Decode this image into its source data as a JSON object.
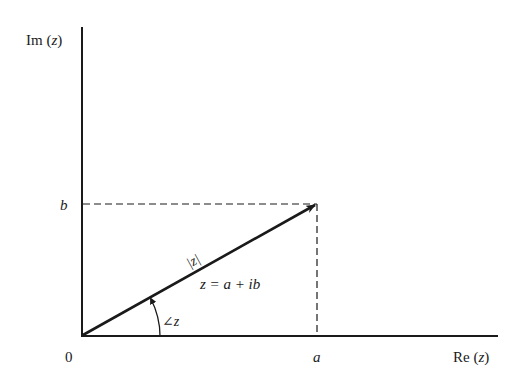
{
  "diagram": {
    "axes": {
      "y_label": "Im (z)",
      "y_label_parts": [
        "Im (",
        "z",
        ")"
      ],
      "x_label": "Re (z)",
      "x_label_parts": [
        "Re (",
        "z",
        ")"
      ],
      "origin_label": "0"
    },
    "ticks": {
      "x_tick": "a",
      "y_tick": "b"
    },
    "vector": {
      "magnitude_label": "|z|",
      "equation_label": "z = a + ib",
      "angle_label": "∠z"
    },
    "colors": {
      "ink": "#1a1a1a",
      "background": "#ffffff"
    }
  }
}
